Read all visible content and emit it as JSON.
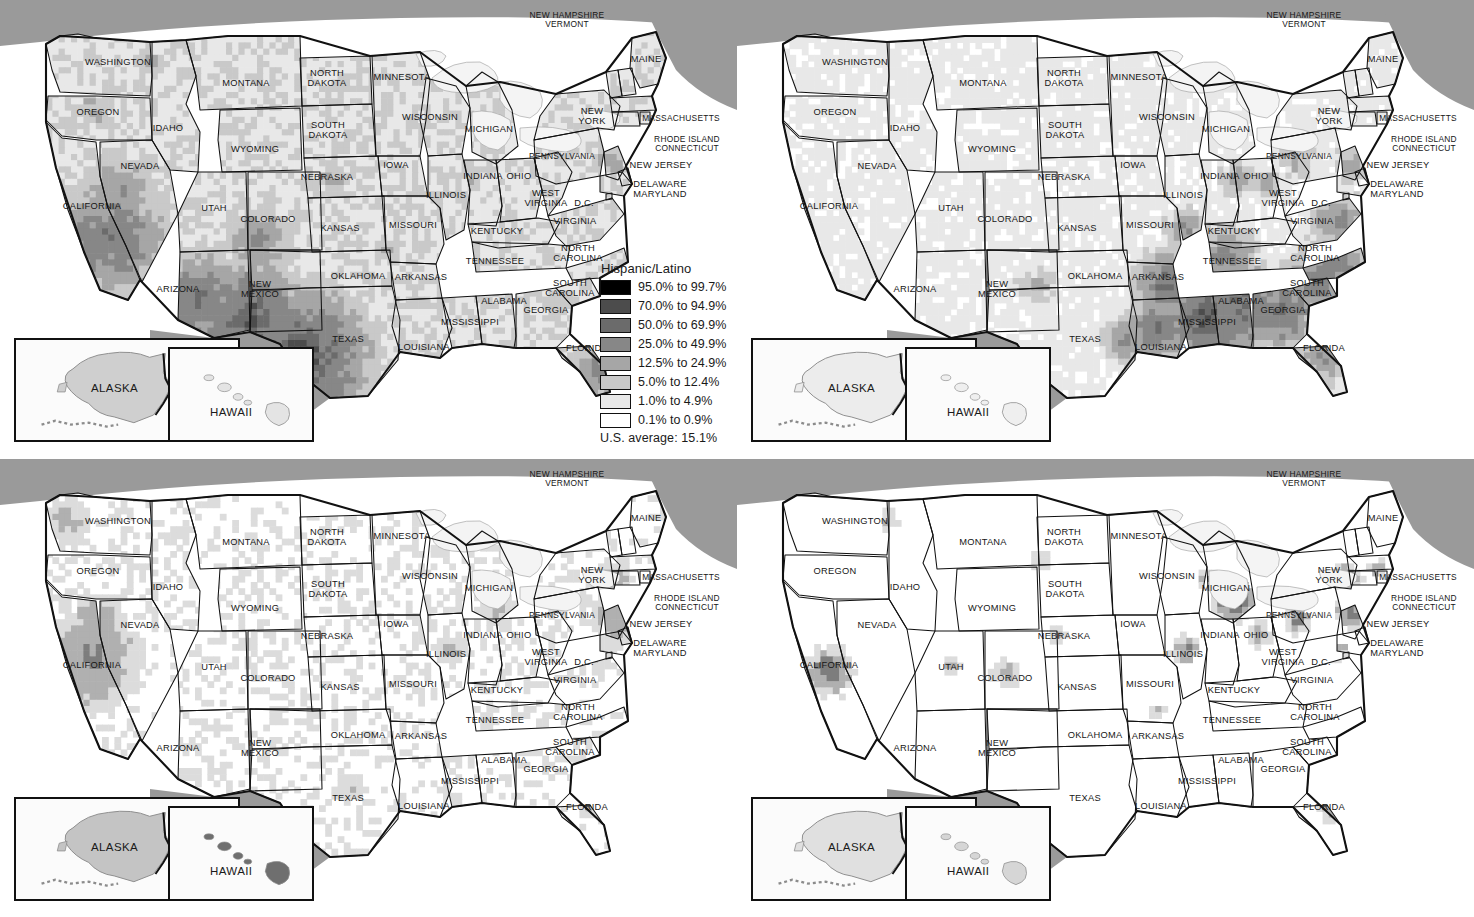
{
  "figure": {
    "type": "choropleth-map-grid",
    "rows": 2,
    "cols": 2,
    "geography": "United States by county, with Alaska and Hawaii insets"
  },
  "colors": {
    "canada_fill": "#9a9a9a",
    "ocean_fill": "#ffffff",
    "lake_fill": "#f2f2f2",
    "border_dark": "#111111",
    "ramp": [
      "#000000",
      "#4a4a4a",
      "#6e6e6e",
      "#8c8c8c",
      "#a9a9a9",
      "#c8c8c8",
      "#e2e2e2",
      "#ffffff"
    ]
  },
  "insets": {
    "alaska_label": "ALASKA",
    "hawaii_label": "HAWAII"
  },
  "state_labels": [
    {
      "name": "WASHINGTON",
      "x": 118,
      "y": 63
    },
    {
      "name": "OREGON",
      "x": 98,
      "y": 113
    },
    {
      "name": "IDAHO",
      "x": 168,
      "y": 129
    },
    {
      "name": "MONTANA",
      "x": 246,
      "y": 84
    },
    {
      "name": "WYOMING",
      "x": 255,
      "y": 150
    },
    {
      "name": "NEVADA",
      "x": 140,
      "y": 167
    },
    {
      "name": "UTAH",
      "x": 214,
      "y": 209
    },
    {
      "name": "COLORADO",
      "x": 268,
      "y": 220
    },
    {
      "name": "CALIFORNIA",
      "x": 92,
      "y": 207
    },
    {
      "name": "ARIZONA",
      "x": 178,
      "y": 290
    },
    {
      "name": "NEW\nMEXICO",
      "x": 260,
      "y": 290
    },
    {
      "name": "NORTH\nDAKOTA",
      "x": 327,
      "y": 79
    },
    {
      "name": "SOUTH\nDAKOTA",
      "x": 328,
      "y": 131
    },
    {
      "name": "NEBRASKA",
      "x": 327,
      "y": 178
    },
    {
      "name": "KANSAS",
      "x": 340,
      "y": 229
    },
    {
      "name": "OKLAHOMA",
      "x": 358,
      "y": 277
    },
    {
      "name": "TEXAS",
      "x": 348,
      "y": 340
    },
    {
      "name": "MINNESOTA",
      "x": 402,
      "y": 78
    },
    {
      "name": "IOWA",
      "x": 396,
      "y": 166
    },
    {
      "name": "MISSOURI",
      "x": 413,
      "y": 226
    },
    {
      "name": "ARKANSAS",
      "x": 421,
      "y": 278
    },
    {
      "name": "LOUISIANA",
      "x": 424,
      "y": 348
    },
    {
      "name": "WISCONSIN",
      "x": 430,
      "y": 118
    },
    {
      "name": "ILLINOIS",
      "x": 446,
      "y": 196
    },
    {
      "name": "MISSISSIPPI",
      "x": 470,
      "y": 323
    },
    {
      "name": "MICHIGAN",
      "x": 489,
      "y": 130
    },
    {
      "name": "INDIANA",
      "x": 483,
      "y": 177
    },
    {
      "name": "OHIO",
      "x": 519,
      "y": 177
    },
    {
      "name": "KENTUCKY",
      "x": 497,
      "y": 232
    },
    {
      "name": "TENNESSEE",
      "x": 495,
      "y": 262
    },
    {
      "name": "ALABAMA",
      "x": 504,
      "y": 302
    },
    {
      "name": "GEORGIA",
      "x": 546,
      "y": 311
    },
    {
      "name": "WEST\nVIRGINIA",
      "x": 546,
      "y": 199
    },
    {
      "name": "VIRGINIA",
      "x": 575,
      "y": 222
    },
    {
      "name": "NORTH\nCAROLINA",
      "x": 578,
      "y": 254
    },
    {
      "name": "SOUTH\nCAROLINA",
      "x": 570,
      "y": 289
    },
    {
      "name": "FLORIDA",
      "x": 587,
      "y": 349
    },
    {
      "name": "PENNSYLVANIA",
      "x": 562,
      "y": 156
    },
    {
      "name": "NEW\nYORK",
      "x": 592,
      "y": 117
    },
    {
      "name": "MAINE",
      "x": 646,
      "y": 60
    },
    {
      "name": "NEW HAMPSHIRE\nVERMONT",
      "x": 567,
      "y": 20
    },
    {
      "name": "MASSACHUSETTS",
      "x": 681,
      "y": 118
    },
    {
      "name": "RHODE ISLAND\nCONNECTICUT",
      "x": 687,
      "y": 144
    },
    {
      "name": "NEW JERSEY",
      "x": 661,
      "y": 166
    },
    {
      "name": "DELAWARE\nMARYLAND",
      "x": 660,
      "y": 190
    },
    {
      "name": "D.C.",
      "x": 584,
      "y": 204
    }
  ],
  "maps": [
    {
      "id": "hispanic-latino",
      "title": "Hispanic/Latino",
      "us_average_label": "U.S. average:",
      "us_average_value": "15.1%",
      "legend_bins": [
        {
          "label": "95.0% to 99.7%",
          "color": "#000000"
        },
        {
          "label": "70.0% to 94.9%",
          "color": "#4c4c4c"
        },
        {
          "label": "50.0% to 69.9%",
          "color": "#6b6b6b"
        },
        {
          "label": "25.0% to 49.9%",
          "color": "#878787"
        },
        {
          "label": "12.5% to 24.9%",
          "color": "#a6a6a6"
        },
        {
          "label": "5.0% to 12.4%",
          "color": "#c9c9c9"
        },
        {
          "label": "1.0% to 4.9%",
          "color": "#e8e8e8"
        },
        {
          "label": "0.1% to 0.9%",
          "color": "#ffffff"
        }
      ]
    },
    {
      "id": "african-american",
      "title": "African American",
      "us_average_label": "U.S. average:",
      "us_average_value": "12.8%",
      "legend_bins": [
        {
          "label": "70.0% to 86.5%",
          "color": "#4c4c4c"
        },
        {
          "label": "50.0% to 69.9%",
          "color": "#6b6b6b"
        },
        {
          "label": "25.0% to 49.9%",
          "color": "#878787"
        },
        {
          "label": "12.3% to 24.9%",
          "color": "#a6a6a6"
        },
        {
          "label": "5.0% to 12.2%",
          "color": "#c9c9c9"
        },
        {
          "label": "1.0% to 4.9%",
          "color": "#e8e8e8"
        },
        {
          "label": "0.0% to 0.9%",
          "color": "#ffffff"
        }
      ]
    },
    {
      "id": "asian-american",
      "title": "Asian American",
      "us_average_label": "U.S. average:",
      "us_average_value": "4.4%",
      "legend_bins": [
        {
          "label": "25.0% to 46.0%",
          "color": "#545454"
        },
        {
          "label": "12.5% to 24.9%",
          "color": "#7d7d7d"
        },
        {
          "label": "3.6% to 12.4%",
          "color": "#b0b0b0"
        },
        {
          "label": "1.0% to 3.5%",
          "color": "#dcdcdc"
        },
        {
          "label": "0.0% to 0.9%",
          "color": "#ffffff"
        }
      ]
    },
    {
      "id": "arab-american",
      "title": "Arab American",
      "us_average_label": "U.S. average:",
      "us_average_value": "0.5%",
      "legend_bins": [
        {
          "label": "1.2% to 2.7%",
          "color": "#545454"
        },
        {
          "label": "0.7% to 1.1%",
          "color": "#7d7d7d"
        },
        {
          "label": "0.4% to 0.6%",
          "color": "#b0b0b0"
        },
        {
          "label": "0.2% to 0.3%",
          "color": "#dcdcdc"
        },
        {
          "label": "0.0% to 0.1%",
          "color": "#ffffff"
        }
      ]
    }
  ]
}
